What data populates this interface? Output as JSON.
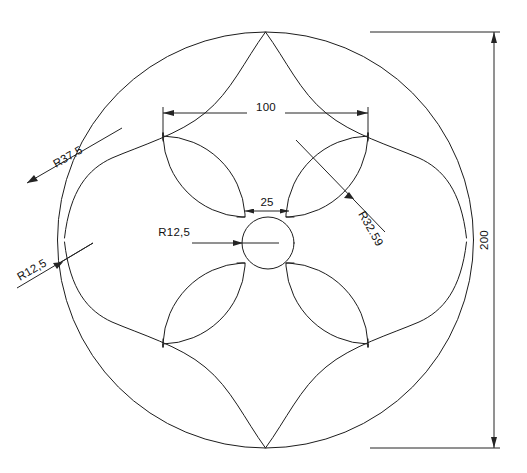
{
  "drawing": {
    "type": "mechanical-2d-cad-drawing",
    "background_color": "#ffffff",
    "line_color": "#1d1d1d",
    "text_color": "#111111",
    "units_hint": "mm",
    "description": "Four-fold symmetric rosette plate: outer circle with four cusped lobes, four lens-shaped petals and a central bore"
  },
  "dimensions": {
    "overall_diameter": {
      "label": "200",
      "orientation": "vertical",
      "position": "right"
    },
    "square_width": {
      "label": "100",
      "orientation": "horizontal",
      "position": "top"
    },
    "gap_width": {
      "label": "25",
      "orientation": "horizontal",
      "position": "center"
    },
    "center_bore_radius": {
      "label": "R12,5",
      "orientation": "horizontal-leader",
      "position": "center-left"
    },
    "lobe_radius": {
      "label": "R37.5",
      "orientation": "rotated-leader",
      "position": "upper-left"
    },
    "fillet_radius": {
      "label": "R12,5",
      "orientation": "rotated-leader",
      "position": "lower-left"
    },
    "petal_radius": {
      "label": "R32.59",
      "orientation": "rotated-leader",
      "position": "upper-right"
    }
  },
  "geometry_values": {
    "outer_circle_diameter": 200,
    "outer_circle_radius": 100,
    "inner_square_span": 100,
    "center_gap": 25,
    "center_bore_radius": 12.5,
    "lobe_radius": 37.5,
    "fillet_radius": 12.5,
    "petal_radius": 32.59
  }
}
